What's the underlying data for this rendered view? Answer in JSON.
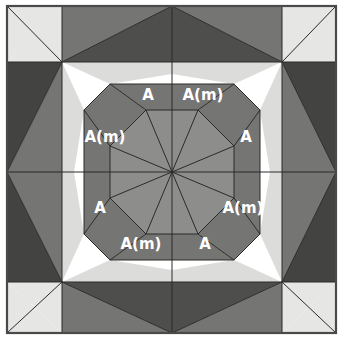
{
  "figure": {
    "canvas": {
      "width": 343,
      "height": 339
    },
    "frame": {
      "x": 7,
      "y": 6,
      "width": 329,
      "height": 327,
      "stroke": "#4a4a4a"
    },
    "center": {
      "x": 172,
      "y": 172
    },
    "grid": {
      "vertical_lines": [
        62,
        172,
        282
      ],
      "horizontal_lines": [
        62,
        172,
        282
      ]
    },
    "palette": {
      "very_light": "#e6e6e4",
      "light": "#dcdcda",
      "mid_gray": "#8d8d8b",
      "ring_gray": "#757573",
      "dark_gray": "#4e4e4c",
      "darkest_gray": "#434341",
      "edge_stroke": "#2b2b2b",
      "label_color": "#ffffff",
      "background": "#ffffff"
    },
    "inner_octagon": {
      "fill": "#8d8d8b",
      "radius_flat": 62,
      "spokes": 8
    },
    "middle_ring": {
      "fill": "#757573",
      "radius_flat": 110
    },
    "labels": [
      {
        "id": "label-top-left",
        "text": "A",
        "x": 148,
        "y": 95,
        "font_size": 15
      },
      {
        "id": "label-top-right",
        "text": "A(m)",
        "x": 203,
        "y": 95,
        "font_size": 15
      },
      {
        "id": "label-left-upper",
        "text": "A(m)",
        "x": 105,
        "y": 137,
        "font_size": 15
      },
      {
        "id": "label-right-upper",
        "text": "A",
        "x": 246,
        "y": 137,
        "font_size": 15
      },
      {
        "id": "label-left-lower",
        "text": "A",
        "x": 100,
        "y": 208,
        "font_size": 15
      },
      {
        "id": "label-right-lower",
        "text": "A(m)",
        "x": 243,
        "y": 208,
        "font_size": 15
      },
      {
        "id": "label-bottom-left",
        "text": "A(m)",
        "x": 141,
        "y": 244,
        "font_size": 15
      },
      {
        "id": "label-bottom-right",
        "text": "A",
        "x": 205,
        "y": 244,
        "font_size": 15
      }
    ],
    "regions": {
      "corner_squares": [
        {
          "id": "corner-top-left",
          "fill": "#e6e6e4"
        },
        {
          "id": "corner-top-right",
          "fill": "#e6e6e4"
        },
        {
          "id": "corner-bottom-left",
          "fill": "#e6e6e4"
        },
        {
          "id": "corner-bottom-right",
          "fill": "#e6e6e4"
        }
      ],
      "edge_blocks": [
        {
          "id": "edge-top-left",
          "fill": "#757573"
        },
        {
          "id": "edge-top-right",
          "fill": "#4e4e4c"
        },
        {
          "id": "edge-bottom-left",
          "fill": "#4e4e4c"
        },
        {
          "id": "edge-bottom-right",
          "fill": "#757573"
        },
        {
          "id": "edge-left-top",
          "fill": "#4e4e4c"
        },
        {
          "id": "edge-left-bottom",
          "fill": "#757573"
        },
        {
          "id": "edge-right-top",
          "fill": "#757573"
        },
        {
          "id": "edge-right-bottom",
          "fill": "#4e4e4c"
        }
      ]
    }
  }
}
